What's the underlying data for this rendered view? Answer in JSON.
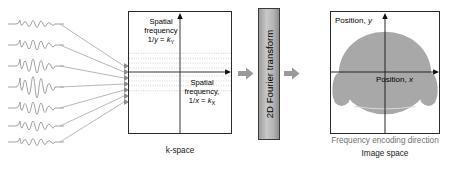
{
  "signals": {
    "name": "echo-waveforms",
    "count": 7
  },
  "kspace": {
    "caption": "k-space",
    "label_y": {
      "line1": "Spatial",
      "line2": "frequency",
      "line3_prefix": "1/",
      "line3_var": "y",
      "line3_eq": " = ",
      "line3_k": "k",
      "line3_sub": "Y"
    },
    "label_x": {
      "line1": "Spatial",
      "line2": "frequency,",
      "line3_prefix": "1/",
      "line3_var": "x",
      "line3_eq": " = ",
      "line3_k": "k",
      "line3_sub": "X"
    }
  },
  "transform": {
    "label": "2D Fourier transform",
    "arrow_left": "arrow-right-icon",
    "arrow_right": "arrow-right-icon"
  },
  "image_space": {
    "caption": "Image space",
    "position_y": "Position, y",
    "position_y_text": "Position, ",
    "position_y_var": "y",
    "position_x_text": "Position, ",
    "position_x_var": "x",
    "phase_direction": "Phase encoding direction",
    "frequency_direction": "Frequency encoding direction"
  },
  "colors": {
    "phantom_fill": "#a8a8a8",
    "box_border": "#2b2b2b",
    "gray_text": "#6f6f6f",
    "arrow_gray": "#9a9a9a",
    "waveform_gray": "#8c8c8c",
    "ft_block": "#b4b4b4"
  }
}
